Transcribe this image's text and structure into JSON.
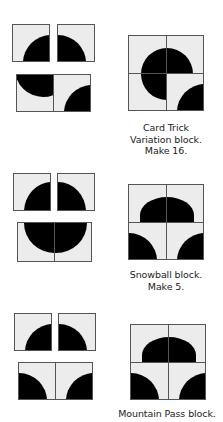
{
  "blocks": [
    {
      "name": "Card Trick Variation",
      "caption_lines": [
        "Card Trick",
        "Variation block.",
        "Make 16."
      ]
    },
    {
      "name": "Snowball",
      "caption_lines": [
        "Snowball block.",
        "Make 5."
      ]
    },
    {
      "name": "Mountain Pass",
      "caption_lines": [
        "Mountain Pass block."
      ]
    }
  ],
  "colors": {
    "fabric_light": "#ececec",
    "fabric_dark": "#000000",
    "outline": "#555555"
  }
}
